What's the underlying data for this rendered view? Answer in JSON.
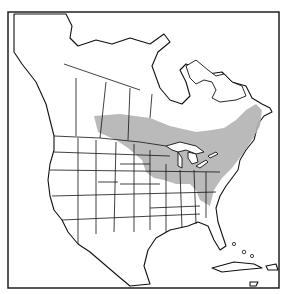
{
  "map": {
    "type": "species-range-map",
    "region": "North America",
    "frame": {
      "x": 8,
      "y": 12,
      "width": 271,
      "height": 276
    },
    "colors": {
      "background": "#ffffff",
      "outline": "#111111",
      "range_fill": "#b3b3b3"
    },
    "range": {
      "description": "Shaded range across southern Canada (Prairies to Quebec/Maritimes), Great Lakes, upper Midwest, and northeastern US south to Appalachians",
      "label": ""
    }
  }
}
